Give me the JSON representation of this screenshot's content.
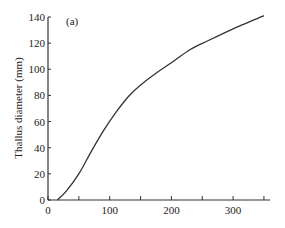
{
  "chart_data": {
    "type": "line",
    "title": "",
    "panel_label": "(a)",
    "xlabel": "",
    "ylabel": "Thallus diameter (mm)",
    "xlim": [
      0,
      360
    ],
    "ylim": [
      0,
      140
    ],
    "x_ticks": [
      0,
      100,
      200,
      300
    ],
    "x_minor_ticks": [
      50,
      150,
      250,
      350
    ],
    "y_ticks": [
      0,
      20,
      40,
      60,
      80,
      100,
      120,
      140
    ],
    "grid": false,
    "legend": null,
    "series": [
      {
        "name": "Thallus diameter",
        "x": [
          15,
          30,
          50,
          70,
          90,
          110,
          130,
          150,
          175,
          200,
          230,
          260,
          300,
          330,
          350
        ],
        "y": [
          0,
          7,
          20,
          37,
          53,
          67,
          79,
          88,
          97,
          105,
          115,
          122,
          131,
          137,
          141
        ]
      }
    ]
  },
  "labels": {
    "panel": "(a)",
    "ylabel": "Thallus diameter (mm)",
    "x_ticks": [
      "0",
      "100",
      "200",
      "300"
    ],
    "y_ticks": [
      "0",
      "20",
      "40",
      "60",
      "80",
      "100",
      "120",
      "140"
    ]
  }
}
